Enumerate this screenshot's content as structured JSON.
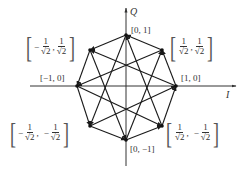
{
  "diagram": {
    "type": "constellation",
    "axes": {
      "horizontal": {
        "label": "I"
      },
      "vertical": {
        "label": "Q"
      }
    },
    "points": [
      {
        "id": "p0",
        "coord_label": "[1, 0]"
      },
      {
        "id": "p1",
        "coord_label": "[1/√2, 1/√2]",
        "num": "1",
        "den": "√2",
        "sign_x": "",
        "sign_y": ""
      },
      {
        "id": "p2",
        "coord_label": "[0, 1]"
      },
      {
        "id": "p3",
        "coord_label": "[−1/√2, 1/√2]",
        "num": "1",
        "den": "√2",
        "sign_x": "−",
        "sign_y": ""
      },
      {
        "id": "p4",
        "coord_label": "[−1, 0]"
      },
      {
        "id": "p5",
        "coord_label": "[−1/√2, −1/√2]",
        "num": "1",
        "den": "√2",
        "sign_x": "−",
        "sign_y": "−"
      },
      {
        "id": "p6",
        "coord_label": "[0, −1]"
      },
      {
        "id": "p7",
        "coord_label": "[1/√2, −1/√2]",
        "num": "1",
        "den": "√2",
        "sign_x": "",
        "sign_y": "−"
      }
    ],
    "labels": {
      "p0": "[1, 0]",
      "p2": "[0, 1]",
      "p4": "[−1, 0]",
      "p6": "[0, −1]",
      "frac_num": "1",
      "frac_den": "√2",
      "minus": "−",
      "comma": ",",
      "open_bracket": "[",
      "close_bracket": "]"
    },
    "colors": {
      "line": "#1a1a1a",
      "axis": "#333333",
      "text": "#333333"
    }
  }
}
